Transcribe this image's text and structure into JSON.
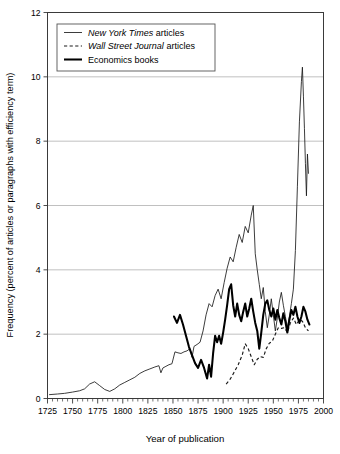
{
  "chart_data": {
    "type": "line",
    "title": "",
    "xlabel": "Year of publication",
    "ylabel": "Frequency (percent of articles or paragraphs with efficiency term)",
    "xlim": [
      1725,
      2000
    ],
    "ylim": [
      0,
      12
    ],
    "xticks": [
      1725,
      1750,
      1775,
      1800,
      1825,
      1850,
      1875,
      1900,
      1925,
      1950,
      1975,
      2000
    ],
    "yticks": [
      0,
      2,
      4,
      6,
      8,
      10,
      12
    ],
    "xtick_labels": [
      "1725",
      "1750",
      "1775",
      "1800",
      "1825",
      "1850",
      "1875",
      "1900",
      "1925",
      "1950",
      "1975",
      "2000"
    ],
    "ytick_labels": [
      "0",
      "2",
      "4",
      "6",
      "8",
      "10",
      "12"
    ],
    "xminor_step": 5,
    "grid": "horizontal",
    "legend_position": "top-left",
    "series": [
      {
        "name": "New York Times articles",
        "name_italic_part": "New York Times",
        "name_plain_part": " articles",
        "style": "thin-solid",
        "color": "#1a1a1a",
        "points": [
          [
            1727,
            0.12
          ],
          [
            1735,
            0.14
          ],
          [
            1742,
            0.16
          ],
          [
            1750,
            0.2
          ],
          [
            1757,
            0.24
          ],
          [
            1762,
            0.3
          ],
          [
            1767,
            0.45
          ],
          [
            1772,
            0.52
          ],
          [
            1777,
            0.4
          ],
          [
            1782,
            0.28
          ],
          [
            1787,
            0.22
          ],
          [
            1792,
            0.3
          ],
          [
            1797,
            0.42
          ],
          [
            1802,
            0.5
          ],
          [
            1807,
            0.58
          ],
          [
            1812,
            0.66
          ],
          [
            1817,
            0.78
          ],
          [
            1822,
            0.86
          ],
          [
            1827,
            0.92
          ],
          [
            1832,
            0.98
          ],
          [
            1836,
            1.02
          ],
          [
            1838,
            0.8
          ],
          [
            1840,
            0.95
          ],
          [
            1843,
            1.0
          ],
          [
            1846,
            1.05
          ],
          [
            1849,
            1.08
          ],
          [
            1852,
            1.45
          ],
          [
            1855,
            1.42
          ],
          [
            1858,
            1.4
          ],
          [
            1861,
            1.45
          ],
          [
            1864,
            1.48
          ],
          [
            1867,
            1.55
          ],
          [
            1869,
            1.28
          ],
          [
            1871,
            1.62
          ],
          [
            1874,
            1.68
          ],
          [
            1877,
            1.75
          ],
          [
            1880,
            2.1
          ],
          [
            1883,
            2.6
          ],
          [
            1886,
            2.95
          ],
          [
            1889,
            2.85
          ],
          [
            1892,
            3.2
          ],
          [
            1895,
            3.4
          ],
          [
            1898,
            3.1
          ],
          [
            1901,
            3.6
          ],
          [
            1904,
            4.05
          ],
          [
            1907,
            4.4
          ],
          [
            1910,
            4.25
          ],
          [
            1913,
            4.7
          ],
          [
            1916,
            5.1
          ],
          [
            1919,
            4.85
          ],
          [
            1922,
            5.35
          ],
          [
            1925,
            5.15
          ],
          [
            1928,
            5.7
          ],
          [
            1930,
            6.0
          ],
          [
            1932,
            4.5
          ],
          [
            1934,
            4.0
          ],
          [
            1936,
            3.55
          ],
          [
            1938,
            3.1
          ],
          [
            1940,
            3.45
          ],
          [
            1942,
            2.7
          ],
          [
            1944,
            2.2
          ],
          [
            1946,
            2.6
          ],
          [
            1948,
            3.1
          ],
          [
            1950,
            2.6
          ],
          [
            1952,
            2.1
          ],
          [
            1954,
            2.5
          ],
          [
            1956,
            3.0
          ],
          [
            1958,
            3.3
          ],
          [
            1960,
            2.9
          ],
          [
            1962,
            2.55
          ],
          [
            1964,
            2.2
          ],
          [
            1966,
            2.55
          ],
          [
            1968,
            2.95
          ],
          [
            1970,
            3.4
          ],
          [
            1972,
            4.6
          ],
          [
            1974,
            6.6
          ],
          [
            1976,
            8.6
          ],
          [
            1978,
            9.85
          ],
          [
            1979,
            10.3
          ],
          [
            1980,
            9.4
          ],
          [
            1981,
            8.4
          ],
          [
            1982,
            7.3
          ],
          [
            1983,
            6.3
          ],
          [
            1984,
            7.6
          ],
          [
            1985,
            7.0
          ]
        ]
      },
      {
        "name": "Wall Street Journal articles",
        "name_italic_part": "Wall Street Journal",
        "name_plain_part": " articles",
        "style": "dashed",
        "color": "#1a1a1a",
        "points": [
          [
            1903,
            0.45
          ],
          [
            1907,
            0.6
          ],
          [
            1911,
            0.82
          ],
          [
            1915,
            1.05
          ],
          [
            1919,
            1.35
          ],
          [
            1922,
            1.7
          ],
          [
            1925,
            1.55
          ],
          [
            1928,
            1.3
          ],
          [
            1931,
            1.05
          ],
          [
            1934,
            1.22
          ],
          [
            1937,
            1.3
          ],
          [
            1940,
            1.28
          ],
          [
            1943,
            1.55
          ],
          [
            1946,
            1.72
          ],
          [
            1949,
            1.78
          ],
          [
            1952,
            2.0
          ],
          [
            1955,
            2.2
          ],
          [
            1958,
            2.18
          ],
          [
            1961,
            2.2
          ],
          [
            1964,
            2.05
          ],
          [
            1967,
            2.35
          ],
          [
            1970,
            2.5
          ],
          [
            1973,
            2.3
          ],
          [
            1976,
            2.45
          ],
          [
            1979,
            2.4
          ],
          [
            1982,
            2.2
          ],
          [
            1985,
            2.1
          ]
        ]
      },
      {
        "name": "Economics books",
        "name_italic_part": "",
        "name_plain_part": "Economics books",
        "style": "thick-solid",
        "color": "#000000",
        "points": [
          [
            1851,
            2.55
          ],
          [
            1854,
            2.35
          ],
          [
            1857,
            2.6
          ],
          [
            1860,
            2.3
          ],
          [
            1863,
            1.95
          ],
          [
            1866,
            1.6
          ],
          [
            1869,
            1.35
          ],
          [
            1872,
            1.1
          ],
          [
            1875,
            0.95
          ],
          [
            1878,
            1.2
          ],
          [
            1881,
            0.95
          ],
          [
            1884,
            0.62
          ],
          [
            1886,
            1.05
          ],
          [
            1888,
            0.68
          ],
          [
            1890,
            1.4
          ],
          [
            1892,
            1.95
          ],
          [
            1894,
            1.75
          ],
          [
            1896,
            1.95
          ],
          [
            1898,
            1.7
          ],
          [
            1900,
            2.05
          ],
          [
            1902,
            2.45
          ],
          [
            1904,
            2.9
          ],
          [
            1906,
            3.4
          ],
          [
            1908,
            3.55
          ],
          [
            1910,
            2.9
          ],
          [
            1912,
            2.55
          ],
          [
            1914,
            2.95
          ],
          [
            1916,
            2.6
          ],
          [
            1918,
            2.4
          ],
          [
            1920,
            2.7
          ],
          [
            1922,
            2.95
          ],
          [
            1924,
            2.55
          ],
          [
            1926,
            2.8
          ],
          [
            1928,
            3.1
          ],
          [
            1930,
            2.7
          ],
          [
            1932,
            2.35
          ],
          [
            1934,
            2.1
          ],
          [
            1936,
            1.55
          ],
          [
            1938,
            2.05
          ],
          [
            1940,
            2.6
          ],
          [
            1942,
            2.95
          ],
          [
            1944,
            3.05
          ],
          [
            1946,
            2.75
          ],
          [
            1948,
            2.55
          ],
          [
            1950,
            2.8
          ],
          [
            1952,
            2.45
          ],
          [
            1954,
            2.75
          ],
          [
            1956,
            2.5
          ],
          [
            1958,
            2.3
          ],
          [
            1960,
            2.65
          ],
          [
            1962,
            2.4
          ],
          [
            1964,
            2.05
          ],
          [
            1966,
            2.45
          ],
          [
            1968,
            2.75
          ],
          [
            1970,
            2.6
          ],
          [
            1972,
            2.85
          ],
          [
            1974,
            2.55
          ],
          [
            1976,
            2.35
          ],
          [
            1978,
            2.55
          ],
          [
            1980,
            2.85
          ],
          [
            1982,
            2.7
          ],
          [
            1984,
            2.45
          ],
          [
            1986,
            2.3
          ]
        ]
      }
    ]
  },
  "legend": {
    "items": [
      {
        "italic": "New York Times",
        "plain": " articles",
        "style": "thin-solid"
      },
      {
        "italic": "Wall Street Journal",
        "plain": " articles",
        "style": "dashed"
      },
      {
        "italic": "",
        "plain": "Economics books",
        "style": "thick-solid"
      }
    ]
  }
}
